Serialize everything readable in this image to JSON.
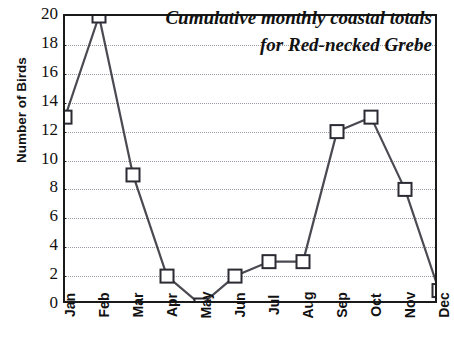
{
  "chart_data": {
    "type": "line",
    "title_lines": [
      "Cumulative monthly coastal totals",
      "for Red-necked Grebe"
    ],
    "xlabel": "",
    "ylabel": "Number of Birds",
    "categories": [
      "Jan",
      "Feb",
      "Mar",
      "Apr",
      "May",
      "Jun",
      "Jul",
      "Aug",
      "Sep",
      "Oct",
      "Nov",
      "Dec"
    ],
    "values": [
      13,
      20,
      9,
      2,
      0,
      2,
      3,
      3,
      12,
      13,
      8,
      1
    ],
    "series": [
      {
        "name": "Red-necked Grebe",
        "values": [
          13,
          20,
          9,
          2,
          0,
          2,
          3,
          3,
          12,
          13,
          8,
          1
        ]
      }
    ],
    "ylim": [
      0,
      20
    ],
    "ytick_step": 2,
    "ytick_labels": [
      "20",
      "18",
      "16",
      "14",
      "12",
      "10",
      "8",
      "6",
      "4",
      "2",
      "0"
    ],
    "ytick_values": [
      20,
      18,
      16,
      14,
      12,
      10,
      8,
      6,
      4,
      2,
      0
    ],
    "grid": true,
    "grid_axis": "y",
    "grid_style": "dotted",
    "legend": "none",
    "marker": "square",
    "marker_fill": "#ffffff",
    "colors": {
      "line": "#4a4a52",
      "marker_edge": "#2b2b33",
      "marker_fill": "#ffffff",
      "grid": "#9a9aa5",
      "axis": "#1a1a1a",
      "text": "#111111",
      "background": "#ffffff"
    }
  }
}
